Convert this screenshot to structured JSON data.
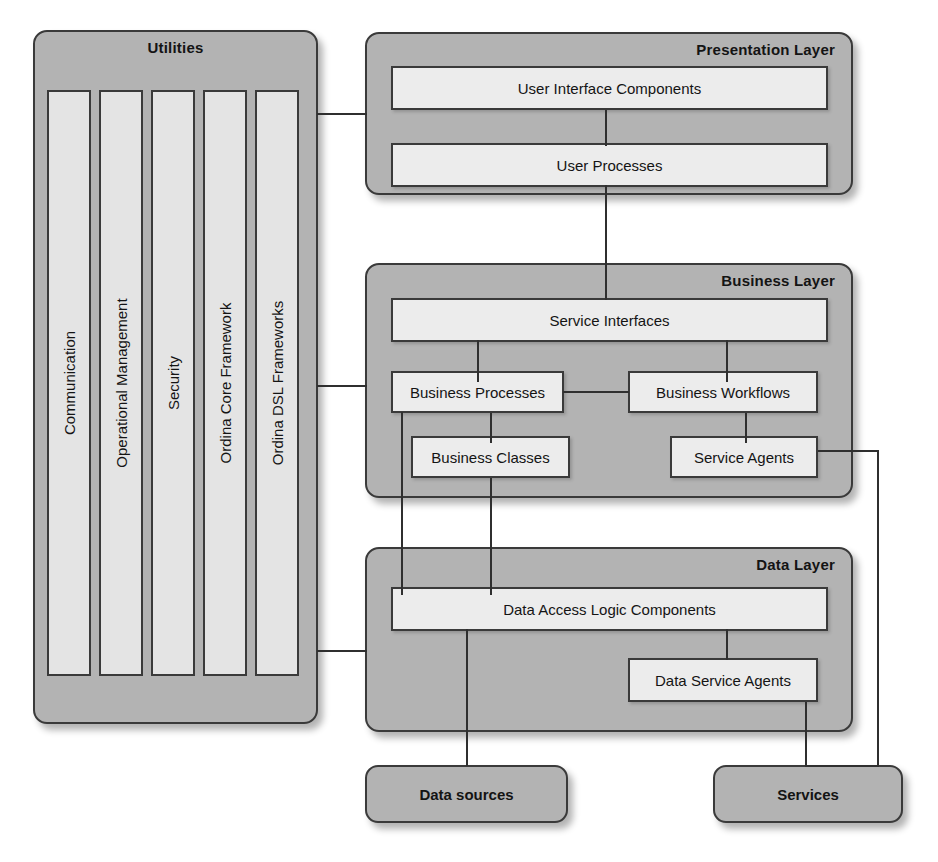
{
  "diagram": {
    "colors": {
      "layer_fill": "#b3b3b3",
      "node_fill": "#ececec",
      "column_fill": "#e4e4e4",
      "stroke": "#3a3a3a",
      "connector": "#2f2f2f",
      "background": "#ffffff",
      "text": "#141414"
    }
  },
  "utilities": {
    "title": "Utilities",
    "columns": [
      {
        "label": "Communication"
      },
      {
        "label": "Operational Management"
      },
      {
        "label": "Security"
      },
      {
        "label": "Ordina Core Framework"
      },
      {
        "label": "Ordina DSL Frameworks"
      }
    ]
  },
  "presentation_layer": {
    "title": "Presentation Layer",
    "nodes": [
      {
        "label": "User Interface Components"
      },
      {
        "label": "User Processes"
      }
    ]
  },
  "business_layer": {
    "title": "Business  Layer",
    "nodes": [
      {
        "label": "Service Interfaces"
      },
      {
        "label": "Business Processes"
      },
      {
        "label": "Business Workflows"
      },
      {
        "label": "Business Classes"
      },
      {
        "label": "Service Agents"
      }
    ]
  },
  "data_layer": {
    "title": "Data Layer",
    "nodes": [
      {
        "label": "Data Access Logic Components"
      },
      {
        "label": "Data Service Agents"
      }
    ]
  },
  "external": {
    "nodes": [
      {
        "label": "Data sources"
      },
      {
        "label": "Services"
      }
    ]
  }
}
